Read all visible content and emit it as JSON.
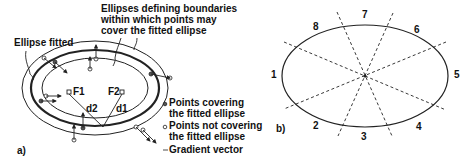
{
  "panel_a": {
    "panel_label": "a)",
    "title_boundaries": [
      "Ellipses defining boundaries",
      "within which points may",
      "cover the fitted ellipse"
    ],
    "label_fitted": "Ellipse fitted",
    "focus_1": "F1",
    "focus_2": "F2",
    "distance_1": "d1",
    "distance_2": "d2",
    "legend": {
      "covering": [
        "Points covering",
        "the fitted ellipse"
      ],
      "not_covering": [
        "Points not covering",
        "the fitted ellipse"
      ],
      "gradient": "Gradient vector"
    }
  },
  "panel_b": {
    "panel_label": "b)",
    "sectors": [
      "1",
      "2",
      "3",
      "4",
      "5",
      "6",
      "7",
      "8"
    ]
  }
}
